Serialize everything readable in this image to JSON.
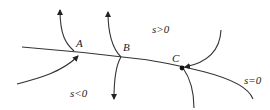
{
  "diagram": {
    "type": "phase-portrait",
    "stroke_color": "#333333",
    "background": "#ffffff",
    "points": [
      {
        "id": "A",
        "label": "A"
      },
      {
        "id": "B",
        "label": "B"
      },
      {
        "id": "C",
        "label": "C"
      }
    ],
    "regions": {
      "positive": "s>0",
      "negative": "s<0",
      "switching_line": "s=0"
    }
  }
}
